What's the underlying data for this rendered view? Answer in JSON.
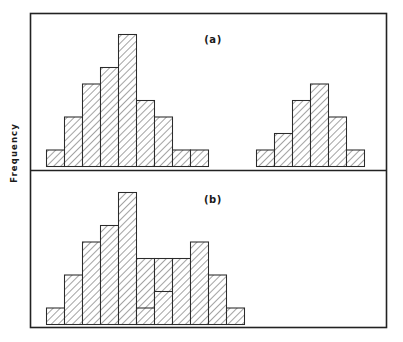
{
  "figure": {
    "ylabel": "Frequency",
    "frame": {
      "x": 30,
      "y": 13,
      "width": 356,
      "height": 314,
      "color": "#222222"
    },
    "divider_y": 170
  },
  "panels": [
    {
      "id": "a",
      "label": "(a)",
      "label_x": 213,
      "label_y": 43
    },
    {
      "id": "b",
      "label": "(b)",
      "label_x": 213,
      "label_y": 203
    }
  ],
  "chart_data": {
    "type": "bar",
    "title": "",
    "xlabel": "",
    "ylabel": "Frequency",
    "grid": false,
    "legend": null,
    "subplots": [
      {
        "panel": "a",
        "baseline_y": 166,
        "bin_width": 18,
        "groups": [
          {
            "name": "distribution-1",
            "bin_start_x": 46,
            "bin_edges": [
              1,
              2,
              3,
              4,
              5,
              6,
              7,
              8,
              9,
              10
            ],
            "values": [
              1,
              3,
              5,
              6,
              8,
              4,
              3,
              1,
              1
            ]
          },
          {
            "name": "distribution-2",
            "bin_start_x": 256,
            "bin_edges": [
              12,
              13,
              14,
              15,
              16,
              17,
              18
            ],
            "values": [
              1,
              2,
              4,
              5,
              3,
              1
            ]
          }
        ],
        "ylim": [
          0,
          8
        ],
        "unit_height": 16.5
      },
      {
        "panel": "b",
        "baseline_y": 324,
        "bin_width": 18,
        "groups": [
          {
            "name": "distribution-1",
            "bin_start_x": 46,
            "bin_edges": [
              1,
              2,
              3,
              4,
              5,
              6,
              7,
              8,
              9,
              10
            ],
            "values": [
              1,
              3,
              5,
              6,
              8,
              4,
              4,
              1,
              1
            ]
          },
          {
            "name": "distribution-2",
            "bin_start_x": 136,
            "bin_edges": [
              6,
              7,
              8,
              9,
              10,
              11,
              12
            ],
            "values": [
              1,
              2,
              4,
              5,
              3,
              1
            ]
          }
        ],
        "ylim": [
          0,
          8
        ],
        "unit_height": 16.5
      }
    ]
  }
}
